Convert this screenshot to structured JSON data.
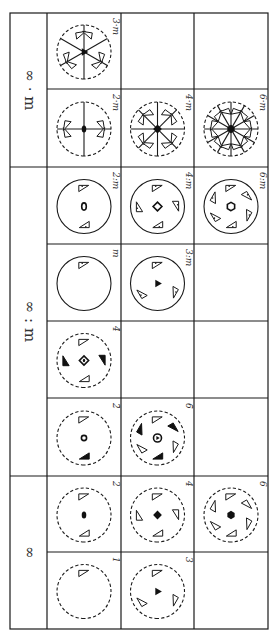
{
  "figure": {
    "orientation": "rotated 90 degrees clockwise",
    "line_color": "#1a1a1a",
    "background": "#ffffff"
  },
  "groups": [
    {
      "id": "inf-dot-m",
      "label": "∞ · m",
      "rows": [
        [
          {
            "label": "3·m",
            "symbol": "3m"
          },
          null,
          null
        ],
        [
          {
            "label": "2·m",
            "symbol": "2m"
          },
          {
            "label": "4·m",
            "symbol": "4m"
          },
          {
            "label": "6·m",
            "symbol": "6m"
          }
        ]
      ]
    },
    {
      "id": "inf-colon-m",
      "label": "∞ : m",
      "rows": [
        [
          {
            "label": "2:m",
            "symbol": "2:m"
          },
          {
            "label": "4:m",
            "symbol": "4:m"
          },
          {
            "label": "6:m",
            "symbol": "6:m"
          }
        ],
        [
          {
            "label": "m",
            "symbol": "m"
          },
          {
            "label": "3:m",
            "symbol": "3:m"
          },
          null
        ],
        [
          {
            "label": "4̄",
            "symbol": "-4"
          },
          null,
          null
        ],
        [
          {
            "label": "2̄",
            "symbol": "-2"
          },
          {
            "label": "6̄",
            "symbol": "-6"
          },
          null
        ]
      ]
    },
    {
      "id": "inf",
      "label": "∞",
      "rows": [
        [
          {
            "label": "2",
            "symbol": "2"
          },
          {
            "label": "4",
            "symbol": "4"
          },
          {
            "label": "6",
            "symbol": "6"
          }
        ],
        [
          {
            "label": "1",
            "symbol": "1"
          },
          {
            "label": "3",
            "symbol": "3"
          },
          null
        ]
      ]
    }
  ],
  "layout": {
    "x_edges": [
      10,
      47,
      121,
      194,
      268
    ],
    "group_y": [
      [
        13,
        167
      ],
      [
        167,
        476
      ],
      [
        476,
        629
      ]
    ],
    "row_y": [
      [
        13,
        89,
        167
      ],
      [
        167,
        244,
        321,
        398,
        476
      ],
      [
        476,
        552,
        629
      ]
    ]
  }
}
